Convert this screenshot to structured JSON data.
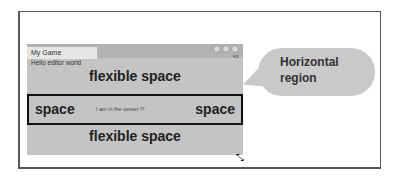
{
  "window": {
    "title": "My Game",
    "label": "Hello editor world",
    "flexible_top": "flexible space",
    "flexible_bottom": "flexible space",
    "horizontal": {
      "left": "space",
      "center": "I am in the center !!!",
      "right": "space"
    }
  },
  "callout": {
    "text_line1": "Horizontal",
    "text_line2": "region"
  },
  "icons": [
    "window-buttons-icon",
    "menu-icon",
    "resize-handle-icon"
  ]
}
